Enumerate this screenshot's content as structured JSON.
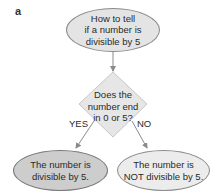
{
  "panel_label": "a",
  "nodes": {
    "start": {
      "shape": "ellipse",
      "line1": "How to tell",
      "line2": "if a number is",
      "line3": "divisible by 5",
      "fill": "#e4e4e4"
    },
    "decision": {
      "shape": "diamond",
      "line1": "Does the",
      "line2": "number end",
      "line3": "in 0 or 5?",
      "fill": "#e6e6e6"
    },
    "yes_result": {
      "shape": "ellipse",
      "line1": "The number is",
      "line2": "divisible by 5.",
      "fill": "#cdcdcd"
    },
    "no_result": {
      "shape": "ellipse",
      "line1": "The number is",
      "line2": "NOT divisible by 5.",
      "fill": "#ececec"
    }
  },
  "edges": {
    "start_to_decision": {
      "label": ""
    },
    "yes": {
      "label": "YES"
    },
    "no": {
      "label": "NO"
    }
  },
  "colors": {
    "stroke": "#8a8a8a",
    "arrow": "#8a8a8a"
  }
}
